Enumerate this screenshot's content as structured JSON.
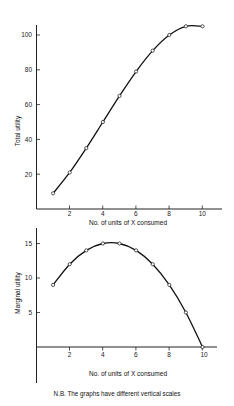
{
  "chart_data": [
    {
      "type": "line",
      "title": "",
      "xlabel": "No. of units of X consumed",
      "ylabel": "Total utility",
      "x": [
        1,
        2,
        3,
        4,
        5,
        6,
        7,
        8,
        9,
        10
      ],
      "values": [
        9,
        21,
        35,
        50,
        65,
        79,
        91,
        100,
        105,
        105
      ],
      "xticks": [
        "2",
        "4",
        "6",
        "8",
        "10"
      ],
      "yticks": [
        "20",
        "40",
        "60",
        "80",
        "100"
      ],
      "ylim": [
        0,
        110
      ],
      "xlim": [
        0,
        11
      ],
      "grid": false,
      "markers": "open-circle"
    },
    {
      "type": "line",
      "title": "",
      "xlabel": "No. of units of X consumed",
      "ylabel": "Marginal utility",
      "x": [
        1,
        2,
        3,
        4,
        5,
        6,
        7,
        8,
        9,
        10
      ],
      "values": [
        9,
        12,
        14,
        15,
        15,
        14,
        12,
        9,
        5,
        0
      ],
      "xticks": [
        "2",
        "4",
        "6",
        "8",
        "10"
      ],
      "yticks": [
        "5",
        "10",
        "15"
      ],
      "ylim": [
        -5,
        17
      ],
      "xlim": [
        0,
        11
      ],
      "grid": false,
      "markers": "open-circle"
    }
  ],
  "top": {
    "ylabel": "Total utility",
    "xlabel": "No. of units of X consumed",
    "yticks": [
      "20",
      "40",
      "60",
      "80",
      "100"
    ],
    "xticks": [
      "2",
      "4",
      "6",
      "8",
      "10"
    ]
  },
  "bottom": {
    "ylabel": "Marginal utility",
    "xlabel": "No. of units of X consumed",
    "yticks": [
      "5",
      "10",
      "15"
    ],
    "xticks": [
      "2",
      "4",
      "6",
      "8",
      "10"
    ]
  },
  "footnote": "N.B. The graphs have different vertical scales"
}
